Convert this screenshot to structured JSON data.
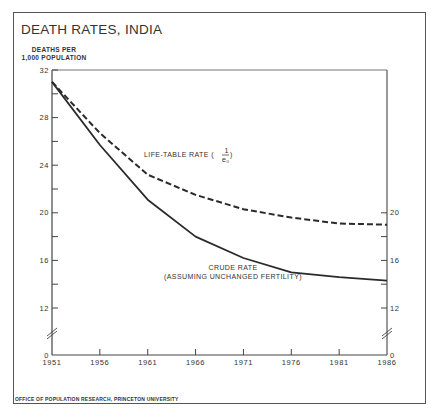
{
  "chart_data": {
    "type": "line",
    "title": "DEATH RATES, INDIA",
    "ylabel_lines": [
      "DEATHS PER",
      "1,000 POPULATION"
    ],
    "xlabel": "",
    "x": [
      1951,
      1956,
      1961,
      1966,
      1971,
      1976,
      1981,
      1986
    ],
    "xlim": [
      1951,
      1986
    ],
    "ylim": [
      0,
      32
    ],
    "axis_break": "between 0 and 12 (both axes)",
    "left_y_ticks": [
      0,
      12,
      14,
      16,
      18,
      20,
      22,
      24,
      26,
      28,
      30,
      32
    ],
    "left_y_tick_labels": [
      "0",
      "12",
      "16",
      "20",
      "24",
      "28",
      "32"
    ],
    "right_y_ticks": [
      0,
      12,
      14,
      16,
      18,
      20
    ],
    "right_y_tick_labels": [
      "0",
      "12",
      "16",
      "20"
    ],
    "x_tick_labels": [
      "1951",
      "1956",
      "1961",
      "1966",
      "1971",
      "1976",
      "1981",
      "1986"
    ],
    "grid": false,
    "series": [
      {
        "name": "LIFE-TABLE RATE (1/e₀)",
        "label_main": "LIFE-TABLE RATE (",
        "label_num": "1",
        "label_den": "e₀",
        "style": "dashed",
        "values": [
          31.0,
          26.7,
          23.2,
          21.5,
          20.3,
          19.6,
          19.1,
          19.0
        ]
      },
      {
        "name": "CRUDE RATE (ASSUMING UNCHANGED FERTILITY)",
        "label_line1": "CRUDE RATE",
        "label_line2": "(ASSUMING UNCHANGED FERTILITY)",
        "style": "solid",
        "values": [
          31.0,
          25.7,
          21.1,
          18.0,
          16.2,
          15.0,
          14.6,
          14.3
        ]
      }
    ],
    "source": "OFFICE OF POPULATION RESEARCH, PRINCETON UNIVERSITY",
    "line_color": "#2a2a2a"
  }
}
